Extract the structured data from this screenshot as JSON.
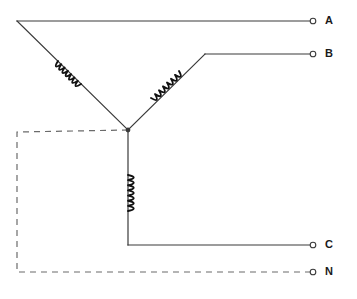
{
  "diagram": {
    "type": "electrical-schematic",
    "canvas": {
      "width": 357,
      "height": 299
    },
    "colors": {
      "background": "#ffffff",
      "wire": "#3a3a3a",
      "coil": "#111111",
      "neutral_dashed": "#6b6b6b",
      "label_text": "#1a1a1a",
      "terminal_stroke": "#3a3a3a",
      "terminal_fill": "#ffffff"
    },
    "star_point": {
      "x": 128,
      "y": 130
    },
    "terminals": [
      {
        "id": "A",
        "label": "A",
        "cx": 313,
        "cy": 21,
        "label_x": 325,
        "label_y": 15,
        "line_style": "solid"
      },
      {
        "id": "B",
        "label": "B",
        "cx": 313,
        "cy": 54,
        "label_x": 325,
        "label_y": 48,
        "line_style": "solid"
      },
      {
        "id": "C",
        "label": "C",
        "cx": 313,
        "cy": 245,
        "label_x": 325,
        "label_y": 239,
        "line_style": "solid"
      },
      {
        "id": "N",
        "label": "N",
        "cx": 313,
        "cy": 272,
        "label_x": 325,
        "label_y": 266,
        "line_style": "dashed"
      }
    ],
    "terminal_radius": 2.8,
    "wires": [
      {
        "name": "phase-a-wire",
        "points": "17,21 313,21",
        "style": "solid"
      },
      {
        "name": "phase-a-winding-leg",
        "points": "17,21 128,130",
        "style": "solid"
      },
      {
        "name": "phase-b-wire",
        "points": "205,54 313,54",
        "style": "solid"
      },
      {
        "name": "phase-b-winding-leg",
        "points": "128,130 205,54",
        "style": "solid"
      },
      {
        "name": "phase-c-winding-leg",
        "points": "128,130 128,245",
        "style": "solid"
      },
      {
        "name": "phase-c-wire",
        "points": "128,245 313,245",
        "style": "solid"
      }
    ],
    "neutral_path": {
      "name": "neutral-dashed-path",
      "points": "128,130 17,132 17,272 313,272",
      "dash": "6,5"
    },
    "coils": [
      {
        "name": "phase-a-coil",
        "orientation": "diagonal-left",
        "x1": 58,
        "y1": 61,
        "x2": 81,
        "y2": 84,
        "bumps": 7,
        "amplitude": 5.5
      },
      {
        "name": "phase-b-coil",
        "orientation": "diagonal-right",
        "x1": 151,
        "y1": 98,
        "x2": 179,
        "y2": 71,
        "bumps": 7,
        "amplitude": 5.5
      },
      {
        "name": "phase-c-coil",
        "orientation": "vertical",
        "x1": 128,
        "y1": 175,
        "x2": 128,
        "y2": 211,
        "bumps": 7,
        "amplitude": 6.0
      }
    ]
  }
}
